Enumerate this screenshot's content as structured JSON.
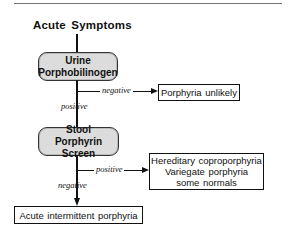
{
  "diagram": {
    "title": "Acute Symptoms",
    "nodes": {
      "urine_test": {
        "line1": "Urine",
        "line2": "Porphobilinogen",
        "shape": "rounded",
        "fill": "#dcdcdc"
      },
      "porphyria_unlikely": {
        "label": "Porphyria unlikely",
        "shape": "rectangle"
      },
      "stool_test": {
        "line1": "Stool",
        "line2": "Porphyrin Screen",
        "shape": "rounded",
        "fill": "#dcdcdc"
      },
      "positive_outcome": {
        "line1": "Hereditary coproporphyria",
        "line2": "Variegate porphyria",
        "line3": "some normals",
        "shape": "rectangle"
      },
      "aip": {
        "label": "Acute intermittent porphyria",
        "shape": "rectangle"
      }
    },
    "edges": [
      {
        "from": "title",
        "to": "urine_test",
        "label": ""
      },
      {
        "from": "urine_test",
        "to": "porphyria_unlikely",
        "label": "negative"
      },
      {
        "from": "urine_test",
        "to": "stool_test",
        "label": "positive"
      },
      {
        "from": "stool_test",
        "to": "positive_outcome",
        "label": "positive"
      },
      {
        "from": "stool_test",
        "to": "aip",
        "label": "negative"
      }
    ],
    "labels": {
      "urine_negative": "negative",
      "urine_positive": "positive",
      "stool_positive": "positive",
      "stool_negative": "negative"
    }
  }
}
